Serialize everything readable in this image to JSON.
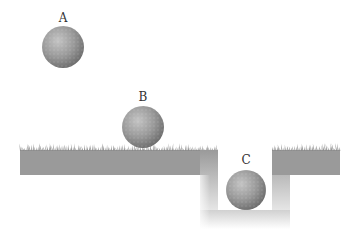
{
  "diagram": {
    "type": "ball-positions-on-ground",
    "balls": [
      {
        "id": "A",
        "label": "A",
        "position": "in the air above ground"
      },
      {
        "id": "B",
        "label": "B",
        "position": "resting on the ground surface"
      },
      {
        "id": "C",
        "label": "C",
        "position": "at the bottom of a pit"
      }
    ],
    "colors": {
      "ball": "#8e8e8e",
      "ground": "#9a9a9a",
      "grass": "#8a8a8a",
      "background": "#ffffff",
      "label": "#333333"
    }
  }
}
